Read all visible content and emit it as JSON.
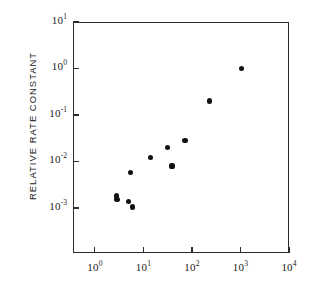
{
  "figure": {
    "width": 314,
    "height": 297,
    "background": "#ffffff",
    "ink_color": "#1a1a1a",
    "marker_color": "#111111"
  },
  "axis_title_y": "RELATIVE RATE CONSTANT",
  "axis_title_x": "",
  "y_ticklabels": [
    {
      "mantissa": "10",
      "exponent": "1"
    },
    {
      "mantissa": "10",
      "exponent": "0"
    },
    {
      "mantissa": "10",
      "exponent": "-1"
    },
    {
      "mantissa": "10",
      "exponent": "-2"
    },
    {
      "mantissa": "10",
      "exponent": "-3"
    }
  ],
  "x_ticklabels": [
    {
      "mantissa": "10",
      "exponent": "0"
    },
    {
      "mantissa": "10",
      "exponent": "1"
    },
    {
      "mantissa": "10",
      "exponent": "2"
    },
    {
      "mantissa": "10",
      "exponent": "3"
    },
    {
      "mantissa": "10",
      "exponent": "4"
    }
  ],
  "chart_data": {
    "type": "scatter",
    "title": "",
    "subtitle": "",
    "xlabel": "",
    "ylabel": "RELATIVE RATE CONSTANT",
    "xscale": "log",
    "yscale": "log",
    "xlim": [
      0.355,
      10000
    ],
    "ylim": [
      0.000107,
      10
    ],
    "xticks": [
      1,
      10,
      100,
      1000,
      10000
    ],
    "xticklabels": [
      "10^0",
      "10^1",
      "10^2",
      "10^3",
      "10^4"
    ],
    "yticks": [
      0.001,
      0.01,
      0.1,
      1,
      10
    ],
    "yticklabels": [
      "10^-3",
      "10^-2",
      "10^-1",
      "10^0",
      "10^1"
    ],
    "grid": false,
    "legend": null,
    "annotations": [],
    "marker": "filled-circle",
    "series": [
      {
        "name": "relative rate constant",
        "x": [
          2.8,
          2.85,
          5.0,
          6.0,
          5.5,
          14.0,
          31.0,
          39.0,
          72.0,
          230.0,
          1050.0
        ],
        "y": [
          0.0018,
          0.0015,
          0.0014,
          0.00105,
          0.0058,
          0.012,
          0.02,
          0.008,
          0.028,
          0.2,
          1.0
        ]
      }
    ]
  },
  "geometry": {
    "plot_left": 73,
    "plot_right": 289,
    "plot_top": 22,
    "plot_bottom": 253,
    "x_decade_px": 48.4,
    "y_decade_px": 46.5,
    "x_origin_px": 95,
    "y_origin_px": 22
  }
}
